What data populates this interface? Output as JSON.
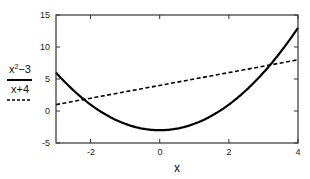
{
  "chart_data": {
    "type": "line",
    "title": "",
    "xlabel": "x",
    "ylabel": "",
    "xlim": [
      -3,
      4
    ],
    "ylim": [
      -5,
      15
    ],
    "grid": false,
    "legend_position": "left",
    "x_ticks": [
      -2,
      0,
      2,
      4
    ],
    "y_ticks": [
      -5,
      0,
      5,
      10,
      15
    ],
    "series": [
      {
        "name": "x²−3",
        "expression": "x^2-3",
        "style": "solid",
        "color": "#000000",
        "x": [
          -3,
          -2.5,
          -2,
          -1.5,
          -1,
          -0.5,
          0,
          0.5,
          1,
          1.5,
          2,
          2.5,
          3,
          3.5,
          4
        ],
        "values": [
          6,
          3.25,
          1,
          -0.75,
          -2,
          -2.75,
          -3,
          -2.75,
          -2,
          -0.75,
          1,
          3.25,
          6,
          9.25,
          13
        ]
      },
      {
        "name": "x+4",
        "expression": "x+4",
        "style": "dashed",
        "color": "#000000",
        "x": [
          -3,
          4
        ],
        "values": [
          1,
          8
        ]
      }
    ]
  },
  "legend": {
    "entries": [
      {
        "label_base": "x",
        "label_sup": "2",
        "label_rest": "−3",
        "style": "solid"
      },
      {
        "label": "x+4",
        "style": "dashed"
      }
    ]
  },
  "axes": {
    "xlabel": "x",
    "x_tick_labels": [
      "-2",
      "0",
      "2",
      "4"
    ],
    "y_tick_labels": [
      "-5",
      "0",
      "5",
      "10",
      "15"
    ]
  }
}
